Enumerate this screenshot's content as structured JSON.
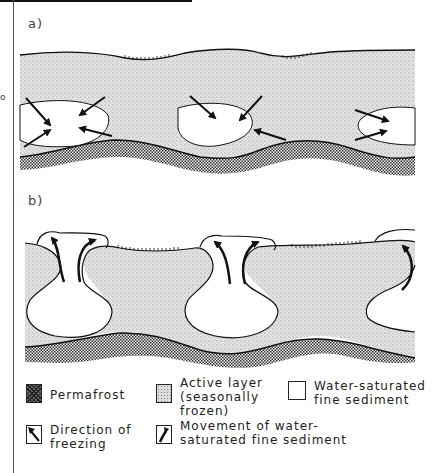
{
  "figure": {
    "panels": [
      {
        "label": "a)",
        "description": "Freezing of active layer around pockets of water-saturated fine sediment"
      },
      {
        "label": "b)",
        "description": "Upward movement of water-saturated fine sediment forming diapirs at surface"
      }
    ],
    "stray_mark": "o"
  },
  "legend": {
    "items": [
      {
        "id": "permafrost",
        "label": "Permafrost",
        "swatch": "crosshatch"
      },
      {
        "id": "active-layer",
        "label": "Active layer\n(seasonally\nfrozen)",
        "swatch": "stipple"
      },
      {
        "id": "water-saturated",
        "label": "Water-saturated\nfine sediment",
        "swatch": "blank"
      },
      {
        "id": "direction-freezing",
        "label": "Direction of\nfreezing",
        "swatch": "straight-arrow"
      },
      {
        "id": "movement",
        "label": "Movement of water-\nsaturated fine sediment",
        "swatch": "curved-arrow"
      }
    ]
  },
  "colors": {
    "line": "#111111",
    "active_layer": "#d8d8d8",
    "permafrost": "#555555",
    "background": "#ffffff"
  }
}
